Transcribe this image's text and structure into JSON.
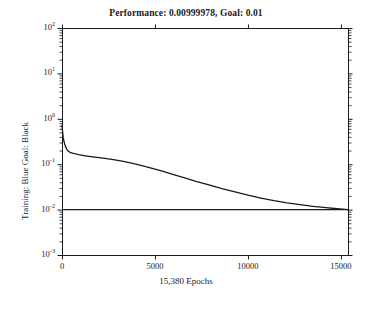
{
  "chart_data": {
    "type": "line",
    "title": "Performance: 0.00999978, Goal: 0.01",
    "xlabel": "15,380 Epochs",
    "ylabel": "Training: Blue Goal: Black",
    "xlim": [
      0,
      15380
    ],
    "ylim": [
      0.001,
      100
    ],
    "yscale": "log",
    "xscale": "linear",
    "grid": false,
    "legend": null,
    "xticks": [
      0,
      5000,
      10000,
      15000
    ],
    "xtick_labels": [
      "0",
      "5000",
      "10000",
      "15000"
    ],
    "yticks": [
      100,
      10,
      1,
      0.1,
      0.01,
      0.001
    ],
    "ytick_labels": [
      "10^2",
      "10^1",
      "10^0",
      "10^-1",
      "10^-2",
      "10^-3"
    ],
    "ytick_mantissas": [
      "10",
      "10",
      "10",
      "10",
      "10",
      "10"
    ],
    "ytick_exponents": [
      "2",
      "1",
      "0",
      "-1",
      "-2",
      "-3"
    ],
    "series": [
      {
        "name": "Training",
        "color": "#1a1a1a",
        "linewidth": 1.3,
        "x": [
          0,
          30,
          70,
          120,
          180,
          250,
          330,
          430,
          560,
          720,
          900,
          1100,
          1350,
          1650,
          2000,
          2400,
          2850,
          3300,
          3800,
          4300,
          4800,
          5400,
          6000,
          6600,
          7200,
          7900,
          8600,
          9300,
          10000,
          10700,
          11400,
          12100,
          12800,
          13500,
          14200,
          14800,
          15380
        ],
        "y": [
          0.72,
          0.52,
          0.38,
          0.3,
          0.25,
          0.215,
          0.195,
          0.183,
          0.175,
          0.168,
          0.162,
          0.157,
          0.151,
          0.145,
          0.139,
          0.132,
          0.124,
          0.115,
          0.104,
          0.093,
          0.082,
          0.07,
          0.059,
          0.05,
          0.042,
          0.035,
          0.029,
          0.0245,
          0.0208,
          0.018,
          0.0158,
          0.0141,
          0.0128,
          0.0118,
          0.011,
          0.01045,
          0.01
        ]
      },
      {
        "name": "Goal",
        "color": "#1a1a1a",
        "linewidth": 1.1,
        "x": [
          0,
          15380
        ],
        "y": [
          0.01,
          0.01
        ]
      }
    ],
    "goal_value": 0.01,
    "performance_value": 0.00999978,
    "epochs_total": 15380,
    "axes_box": {
      "left": 62,
      "right": 348,
      "top": 28,
      "bottom": 255
    },
    "axis_color": "#1a1a1a",
    "background": "#ffffff"
  },
  "figure": {
    "title": "Performance: 0.00999978, Goal: 0.01",
    "xlabel": "15,380 Epochs",
    "ylabel": "Training: Blue Goal: Black"
  }
}
